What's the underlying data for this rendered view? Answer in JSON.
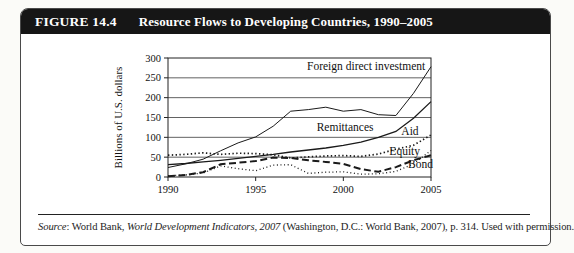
{
  "figure": {
    "label": "FIGURE 14.4",
    "title": "Resource Flows to Developing Countries, 1990–2005"
  },
  "source": {
    "word": "Source",
    "sep": ": World Bank, ",
    "publication": "World Development Indicators, 2007",
    "rest": " (Washington, D.C.: World Bank, 2007), p. 314. Used with permission."
  },
  "chart_data": {
    "type": "line",
    "title": "Resource Flows to Developing Countries, 1990–2005",
    "xlabel": "",
    "ylabel": "Billions of U.S. dollars",
    "xlim": [
      1990,
      2005
    ],
    "ylim": [
      0,
      300
    ],
    "xticks": [
      1990,
      1995,
      2000,
      2005
    ],
    "yticks": [
      0,
      50,
      100,
      150,
      200,
      250,
      300
    ],
    "grid": "horizontal",
    "legend": "inline-labels",
    "line_color": "#1a1a1a",
    "x": [
      1990,
      1991,
      1992,
      1993,
      1994,
      1995,
      1996,
      1997,
      1998,
      1999,
      2000,
      2001,
      2002,
      2003,
      2004,
      2005
    ],
    "series": [
      {
        "id": "foreign-direct-investment",
        "name": "Foreign direct investment",
        "style": "solid",
        "values": [
          24,
          33,
          45,
          66,
          86,
          101,
          128,
          166,
          170,
          176,
          166,
          170,
          157,
          155,
          211,
          278
        ],
        "label_at": {
          "x": 2001.3,
          "y": 270,
          "anchor": "middle"
        }
      },
      {
        "id": "remittances",
        "name": "Remittances",
        "style": "solid-thick",
        "values": [
          31,
          34,
          38,
          42,
          47,
          52,
          57,
          63,
          68,
          73,
          80,
          88,
          100,
          115,
          148,
          190
        ],
        "label_at": {
          "x": 2000.1,
          "y": 116,
          "anchor": "middle"
        }
      },
      {
        "id": "aid",
        "name": "Aid",
        "style": "dotted",
        "values": [
          55,
          57,
          61,
          57,
          60,
          59,
          56,
          48,
          51,
          53,
          54,
          52,
          58,
          70,
          80,
          106
        ],
        "label_at": {
          "x": 2003.8,
          "y": 105,
          "anchor": "middle"
        }
      },
      {
        "id": "equity",
        "name": "Equity",
        "style": "fine-dotted",
        "values": [
          3,
          5,
          10,
          28,
          21,
          16,
          30,
          31,
          9,
          12,
          13,
          7,
          8,
          14,
          33,
          67
        ],
        "label_at": {
          "x": 2003.5,
          "y": 55,
          "anchor": "middle"
        }
      },
      {
        "id": "bond",
        "name": "Bond",
        "style": "dashed",
        "values": [
          2,
          5,
          12,
          32,
          36,
          40,
          49,
          48,
          42,
          38,
          33,
          20,
          13,
          25,
          42,
          55
        ],
        "label_at": {
          "x": 2004.4,
          "y": 23,
          "anchor": "middle"
        }
      }
    ]
  }
}
